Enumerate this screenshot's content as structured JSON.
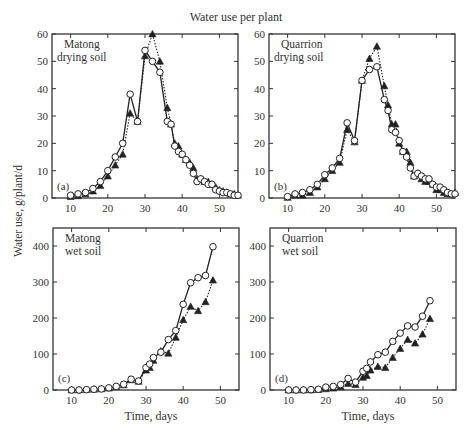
{
  "figure": {
    "title": "Water use per plant",
    "ylabel": "Water use, g/plant/d",
    "xlabel": "Time, days"
  },
  "legend": {
    "open_circle": "series 1 (open circles, solid line)",
    "filled_triangle": "series 2 (filled triangles, dotted line)"
  },
  "chart_data": [
    {
      "type": "line",
      "panel": "(a)",
      "title": "Matong drying soil",
      "xlabel": "",
      "ylabel": "Water use, g/plant/d",
      "xlim": [
        5,
        55
      ],
      "ylim": [
        0,
        60
      ],
      "xticks": [
        10,
        20,
        30,
        40,
        50
      ],
      "yticks": [
        0,
        10,
        20,
        30,
        40,
        50,
        60
      ],
      "series": [
        {
          "name": "open circles",
          "marker": "circle-open",
          "line": "solid",
          "x": [
            10,
            12,
            14,
            16,
            18,
            20,
            22,
            24,
            26,
            28,
            30,
            32,
            34,
            36,
            37,
            38,
            39,
            40,
            41,
            42,
            43,
            44,
            45,
            46,
            47,
            48,
            49,
            50,
            51,
            52,
            53,
            54,
            55
          ],
          "y": [
            1,
            1.5,
            2,
            3.5,
            6,
            10,
            15,
            20,
            38,
            28,
            54,
            50,
            46,
            28,
            27,
            19,
            17,
            16,
            14,
            12,
            9,
            6,
            7,
            6,
            5,
            5,
            3,
            2.5,
            2,
            2,
            1.5,
            1,
            1
          ]
        },
        {
          "name": "filled triangles",
          "marker": "triangle-filled",
          "line": "dotted",
          "x": [
            10,
            12,
            14,
            16,
            18,
            20,
            22,
            24,
            26,
            28,
            30,
            32,
            34,
            36,
            37,
            38,
            39,
            40,
            41,
            42,
            43,
            44,
            45,
            46,
            47,
            48,
            49,
            50,
            51,
            52,
            53,
            54,
            55
          ],
          "y": [
            0.5,
            0.8,
            1.5,
            2.5,
            4.5,
            8,
            12,
            16,
            31,
            28,
            52,
            60,
            50,
            33,
            27,
            20,
            19,
            16,
            14,
            13,
            11,
            7,
            7,
            6,
            6,
            5,
            4,
            3,
            2.5,
            2,
            1.5,
            1.5,
            1
          ]
        }
      ]
    },
    {
      "type": "line",
      "panel": "(b)",
      "title": "Quarrion drying soil",
      "xlim": [
        5,
        55
      ],
      "ylim": [
        0,
        60
      ],
      "xticks": [
        10,
        20,
        30,
        40,
        50
      ],
      "yticks": [
        0,
        10,
        20,
        30,
        40,
        50,
        60
      ],
      "series": [
        {
          "name": "open circles",
          "marker": "circle-open",
          "line": "solid",
          "x": [
            10,
            12,
            14,
            16,
            18,
            20,
            22,
            24,
            26,
            28,
            30,
            32,
            34,
            36,
            37,
            38,
            39,
            40,
            41,
            42,
            43,
            44,
            45,
            46,
            47,
            48,
            49,
            50,
            51,
            52,
            53,
            54,
            55
          ],
          "y": [
            0.5,
            1.5,
            2,
            3,
            5,
            8.5,
            11,
            14.5,
            27.5,
            21,
            43,
            47,
            48,
            36,
            32,
            25,
            24,
            21,
            17,
            15,
            11,
            8,
            9,
            8,
            7,
            7,
            5,
            4,
            4,
            3,
            2,
            1.5,
            1.5
          ]
        },
        {
          "name": "filled triangles",
          "marker": "triangle-filled",
          "line": "dotted",
          "x": [
            10,
            12,
            14,
            16,
            18,
            20,
            22,
            24,
            26,
            28,
            30,
            32,
            34,
            36,
            37,
            38,
            39,
            40,
            41,
            42,
            43,
            44,
            45,
            46,
            47,
            48,
            49,
            50,
            51,
            52,
            53,
            54,
            55
          ],
          "y": [
            0.2,
            1,
            1,
            2,
            4,
            7,
            10,
            13,
            25,
            20.5,
            43,
            51,
            55.5,
            41,
            34,
            27,
            27,
            20,
            17,
            17,
            13,
            8,
            9,
            7,
            6,
            6,
            5,
            3,
            3,
            2,
            1.5,
            1.5,
            2
          ]
        }
      ]
    },
    {
      "type": "line",
      "panel": "(c)",
      "title": "Matong wet soil",
      "xlabel": "Time, days",
      "ylim": [
        0,
        450
      ],
      "xlim": [
        5,
        55
      ],
      "xticks": [
        10,
        20,
        30,
        40,
        50
      ],
      "yticks": [
        0,
        100,
        200,
        300,
        400
      ],
      "series": [
        {
          "name": "open circles",
          "marker": "circle-open",
          "line": "solid",
          "x": [
            10,
            12,
            14,
            16,
            18,
            20,
            22,
            24,
            26,
            28,
            30,
            31,
            32,
            34,
            36,
            38,
            40,
            42,
            44,
            46,
            48
          ],
          "y": [
            0,
            0,
            1,
            2,
            3,
            6,
            10,
            16,
            30,
            25,
            62,
            72,
            90,
            105,
            140,
            165,
            238,
            298,
            312,
            318,
            398
          ]
        },
        {
          "name": "filled triangles",
          "marker": "triangle-filled",
          "line": "dotted",
          "x": [
            10,
            12,
            14,
            16,
            18,
            20,
            22,
            24,
            26,
            28,
            30,
            31,
            32,
            34,
            36,
            38,
            40,
            42,
            44,
            46,
            48
          ],
          "y": [
            0,
            0,
            1,
            2,
            3,
            5,
            9,
            14,
            28,
            24,
            55,
            62,
            82,
            108,
            102,
            146,
            195,
            232,
            220,
            245,
            305
          ]
        }
      ]
    },
    {
      "type": "line",
      "panel": "(d)",
      "title": "Quarrion wet soil",
      "xlabel": "Time, days",
      "ylim": [
        0,
        450
      ],
      "xlim": [
        5,
        55
      ],
      "xticks": [
        10,
        20,
        30,
        40,
        50
      ],
      "yticks": [
        0,
        100,
        200,
        300,
        400
      ],
      "series": [
        {
          "name": "open circles",
          "marker": "circle-open",
          "line": "solid",
          "x": [
            10,
            12,
            14,
            16,
            18,
            20,
            22,
            24,
            26,
            28,
            30,
            31,
            32,
            34,
            36,
            38,
            40,
            42,
            44,
            46,
            48
          ],
          "y": [
            0,
            0,
            0,
            1,
            2,
            8,
            10,
            15,
            32,
            22,
            52,
            60,
            78,
            98,
            105,
            135,
            158,
            178,
            175,
            205,
            248
          ]
        },
        {
          "name": "filled triangles",
          "marker": "triangle-filled",
          "line": "dotted",
          "x": [
            10,
            12,
            14,
            16,
            18,
            20,
            22,
            24,
            26,
            28,
            30,
            31,
            32,
            34,
            36,
            38,
            40,
            42,
            44,
            46,
            48
          ],
          "y": [
            0,
            0,
            0,
            0,
            1,
            3,
            5,
            9,
            18,
            15,
            35,
            40,
            55,
            65,
            62,
            90,
            115,
            140,
            130,
            155,
            198
          ]
        }
      ]
    }
  ]
}
